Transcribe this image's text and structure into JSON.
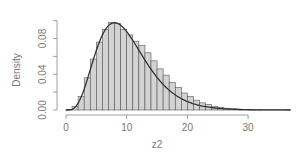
{
  "chart_data": {
    "type": "bar",
    "title": "",
    "xlabel": "z2",
    "ylabel": "Density",
    "xlim": [
      0,
      37
    ],
    "ylim": [
      0,
      0.1
    ],
    "x_ticks": [
      "0",
      "10",
      "20",
      "30"
    ],
    "y_ticks": [
      "0.00",
      "0.02",
      "0.04",
      "0.06",
      "0.08",
      "0.10"
    ],
    "y_tick_labels_shown": [
      "0.00",
      "0.04",
      "0.08"
    ],
    "grid": false,
    "legend": null,
    "bin_width": 1,
    "bins_start": 0,
    "values": [
      0.0005,
      0.004,
      0.015,
      0.036,
      0.057,
      0.076,
      0.09,
      0.098,
      0.097,
      0.09,
      0.084,
      0.077,
      0.072,
      0.064,
      0.055,
      0.046,
      0.039,
      0.031,
      0.025,
      0.019,
      0.015,
      0.011,
      0.008,
      0.006,
      0.004,
      0.003,
      0.002,
      0.0015,
      0.001,
      0.0007,
      0.0005,
      0.0003,
      0.0002,
      0.0001,
      0.0001,
      0.0001,
      0.0001
    ],
    "overlay_curve": {
      "name": "chi-square density (df=10)",
      "type": "line",
      "df": 10,
      "x_range": [
        0,
        37
      ]
    },
    "colors": {
      "bar_fill": "#d3d3d3",
      "bar_stroke": "#555555",
      "curve": "#333333",
      "axis": "#888888",
      "text": "#777777"
    }
  }
}
